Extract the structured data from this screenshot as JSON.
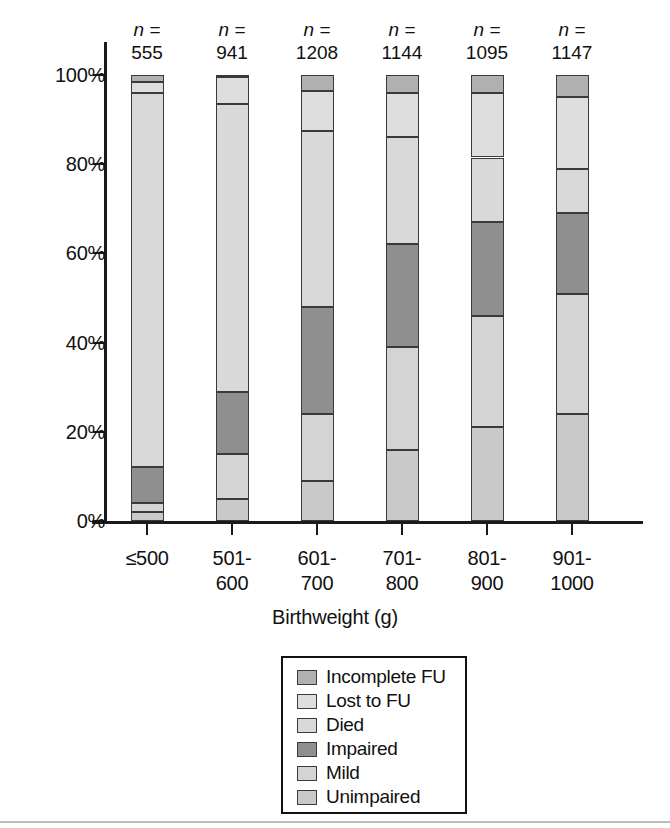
{
  "chart_data": {
    "type": "bar",
    "subtype": "stacked-100-percent",
    "title": "",
    "xlabel": "Birthweight (g)",
    "ylabel": "",
    "ylim": [
      0,
      100
    ],
    "ytick_labels": [
      "0%",
      "20%",
      "40%",
      "60%",
      "80%",
      "100%"
    ],
    "ytick_values": [
      0,
      20,
      40,
      60,
      80,
      100
    ],
    "grid": false,
    "legend_position": "bottom-center",
    "categories": [
      "≤500",
      "501-\n600",
      "601-\n700",
      "701-\n800",
      "801-\n900",
      "901-\n1000"
    ],
    "category_labels": [
      {
        "line1": "≤500",
        "line2": ""
      },
      {
        "line1": "501-",
        "line2": "600"
      },
      {
        "line1": "601-",
        "line2": "700"
      },
      {
        "line1": "701-",
        "line2": "800"
      },
      {
        "line1": "801-",
        "line2": "900"
      },
      {
        "line1": "901-",
        "line2": "1000"
      }
    ],
    "n_prefix": "n =",
    "n_values": [
      555,
      941,
      1208,
      1144,
      1095,
      1147
    ],
    "series": [
      {
        "name": "Unimpaired",
        "color": "#c9c9c9",
        "values": [
          2.0,
          5.0,
          9.0,
          16.0,
          21.0,
          24.0
        ]
      },
      {
        "name": "Mild",
        "color": "#d4d4d4",
        "values": [
          2.0,
          10.0,
          15.0,
          23.0,
          25.0,
          27.0
        ]
      },
      {
        "name": "Impaired",
        "color": "#8f8f8f",
        "values": [
          8.0,
          14.0,
          24.0,
          23.0,
          21.0,
          18.0
        ]
      },
      {
        "name": "Died",
        "color": "#d9d9d9",
        "values": [
          84.0,
          64.5,
          39.5,
          24.0,
          14.5,
          10.0
        ]
      },
      {
        "name": "Lost to FU",
        "color": "#dedede",
        "values": [
          2.5,
          6.0,
          9.0,
          10.0,
          14.5,
          16.0
        ]
      },
      {
        "name": "Incomplete FU",
        "color": "#b0b0b0",
        "values": [
          1.5,
          0.5,
          3.5,
          4.0,
          4.0,
          5.0
        ]
      }
    ],
    "cumulative_tops": [
      {
        "category": "≤500",
        "unimpaired": 2.0,
        "mild": 4.0,
        "impaired": 12.0,
        "died": 96.0,
        "lost_to_fu": 98.5,
        "incomplete_fu": 100.0
      },
      {
        "category": "501-600",
        "unimpaired": 5.0,
        "mild": 15.0,
        "impaired": 29.0,
        "died": 93.5,
        "lost_to_fu": 99.5,
        "incomplete_fu": 100.0
      },
      {
        "category": "601-700",
        "unimpaired": 9.0,
        "mild": 24.0,
        "impaired": 48.0,
        "died": 87.5,
        "lost_to_fu": 96.5,
        "incomplete_fu": 100.0
      },
      {
        "category": "701-800",
        "unimpaired": 16.0,
        "mild": 39.0,
        "impaired": 62.0,
        "died": 86.0,
        "lost_to_fu": 96.0,
        "incomplete_fu": 100.0
      },
      {
        "category": "801-900",
        "unimpaired": 21.0,
        "mild": 46.0,
        "impaired": 67.0,
        "died": 81.5,
        "lost_to_fu": 96.0,
        "incomplete_fu": 100.0
      },
      {
        "category": "901-1000",
        "unimpaired": 24.0,
        "mild": 51.0,
        "impaired": 69.0,
        "died": 79.0,
        "lost_to_fu": 95.0,
        "incomplete_fu": 100.0
      }
    ],
    "legend_entries": [
      {
        "label": "Incomplete FU",
        "color": "#b0b0b0"
      },
      {
        "label": "Lost to FU",
        "color": "#dedede"
      },
      {
        "label": "Died",
        "color": "#d9d9d9"
      },
      {
        "label": "Impaired",
        "color": "#8f8f8f"
      },
      {
        "label": "Mild",
        "color": "#d4d4d4"
      },
      {
        "label": "Unimpaired",
        "color": "#c9c9c9"
      }
    ]
  }
}
